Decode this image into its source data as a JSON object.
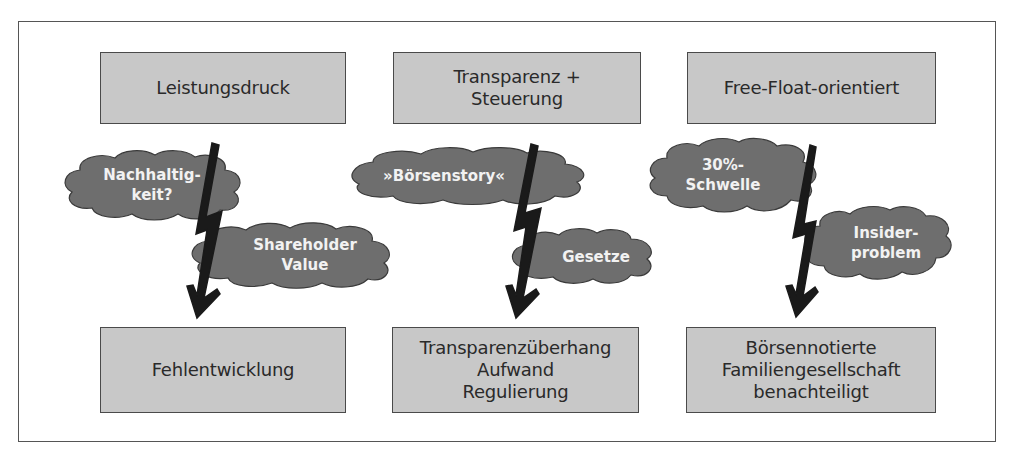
{
  "colors": {
    "box_fill": "#c8c8c8",
    "box_border": "#4a4a4a",
    "cloud_fill": "#6e6e6e",
    "cloud_text": "#f2f2f2",
    "bolt": "#1a1a1a"
  },
  "columns": [
    {
      "top": "Leistungsdruck",
      "cloud_upper": "Nachhaltig-\nkeit?",
      "cloud_lower": "Shareholder\nValue",
      "bottom": "Fehlentwicklung"
    },
    {
      "top": "Transparenz +\nSteuerung",
      "cloud_upper": "»Börsenstory«",
      "cloud_lower": "Gesetze",
      "bottom": "Transparenzüberhang\nAufwand\nRegulierung"
    },
    {
      "top": "Free-Float-orientiert",
      "cloud_upper": "30%-\nSchwelle",
      "cloud_lower": "Insider-\nproblem",
      "bottom": "Börsennotierte\nFamiliengesellschaft\nbenachteiligt"
    }
  ]
}
